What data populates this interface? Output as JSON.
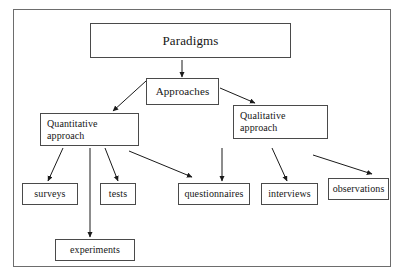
{
  "diagram": {
    "frame": {
      "x": 13,
      "y": 9,
      "width": 378,
      "height": 258,
      "border_color": "#6d6d6d"
    },
    "box_border_color": "#4a4a4a",
    "text_color": "#161616",
    "arrow_color": "#1a1a1a",
    "nodes": [
      {
        "id": "paradigms",
        "label": "Paradigms",
        "x": 90,
        "y": 23,
        "width": 201,
        "height": 35,
        "font_size": 13,
        "align": "center"
      },
      {
        "id": "approaches",
        "label": "Approaches",
        "x": 146,
        "y": 78,
        "width": 73,
        "height": 27,
        "font_size": 11,
        "align": "center"
      },
      {
        "id": "quantitative",
        "label": "Quantitative\napproach",
        "x": 40,
        "y": 113,
        "width": 99,
        "height": 33,
        "font_size": 10,
        "align": "left"
      },
      {
        "id": "qualitative",
        "label": "Qualitative\napproach",
        "x": 233,
        "y": 105,
        "width": 95,
        "height": 34,
        "font_size": 10,
        "align": "left"
      },
      {
        "id": "surveys",
        "label": "surveys",
        "x": 22,
        "y": 183,
        "width": 56,
        "height": 22,
        "font_size": 10,
        "align": "center"
      },
      {
        "id": "tests",
        "label": "tests",
        "x": 100,
        "y": 183,
        "width": 36,
        "height": 22,
        "font_size": 10,
        "align": "center"
      },
      {
        "id": "questionnaires",
        "label": "questionnaires",
        "x": 178,
        "y": 183,
        "width": 72,
        "height": 22,
        "font_size": 10,
        "align": "center"
      },
      {
        "id": "interviews",
        "label": "interviews",
        "x": 261,
        "y": 183,
        "width": 57,
        "height": 22,
        "font_size": 10,
        "align": "center"
      },
      {
        "id": "observations",
        "label": "observations",
        "x": 328,
        "y": 178,
        "width": 61,
        "height": 22,
        "font_size": 10,
        "align": "center"
      },
      {
        "id": "experiments",
        "label": "experiments",
        "x": 55,
        "y": 239,
        "width": 80,
        "height": 22,
        "font_size": 10,
        "align": "center"
      }
    ],
    "edges": [
      {
        "id": "paradigms-to-approaches",
        "from": "paradigms",
        "to": "approaches",
        "x1": 182,
        "y1": 60,
        "x2": 182,
        "y2": 77
      },
      {
        "id": "approaches-to-quantitative",
        "from": "approaches",
        "to": "quantitative",
        "x1": 146,
        "y1": 81,
        "x2": 113,
        "y2": 111
      },
      {
        "id": "approaches-to-qualitative",
        "from": "approaches",
        "to": "qualitative",
        "x1": 220,
        "y1": 88,
        "x2": 255,
        "y2": 103
      },
      {
        "id": "quantitative-to-surveys",
        "from": "quantitative",
        "to": "surveys",
        "x1": 63,
        "y1": 148,
        "x2": 48,
        "y2": 181
      },
      {
        "id": "quantitative-to-experiments",
        "from": "quantitative",
        "to": "experiments",
        "x1": 90,
        "y1": 148,
        "x2": 90,
        "y2": 237
      },
      {
        "id": "quantitative-to-tests",
        "from": "quantitative",
        "to": "tests",
        "x1": 105,
        "y1": 148,
        "x2": 118,
        "y2": 181
      },
      {
        "id": "quantitative-to-questionnaires",
        "from": "quantitative",
        "to": "questionnaires",
        "x1": 129,
        "y1": 151,
        "x2": 192,
        "y2": 177
      },
      {
        "id": "qualitative-to-questionnaires",
        "from": "qualitative",
        "to": "questionnaires",
        "x1": 222,
        "y1": 148,
        "x2": 222,
        "y2": 181
      },
      {
        "id": "qualitative-to-interviews",
        "from": "qualitative",
        "to": "interviews",
        "x1": 272,
        "y1": 148,
        "x2": 287,
        "y2": 181
      },
      {
        "id": "qualitative-to-observations",
        "from": "qualitative",
        "to": "observations",
        "x1": 313,
        "y1": 155,
        "x2": 372,
        "y2": 174
      }
    ]
  }
}
